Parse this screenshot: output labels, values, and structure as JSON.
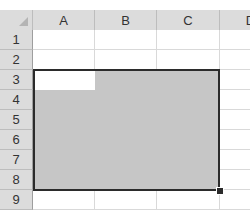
{
  "spreadsheet": {
    "columns": [
      {
        "label": "A",
        "left": 33,
        "width": 62
      },
      {
        "label": "B",
        "left": 95,
        "width": 62
      },
      {
        "label": "C",
        "left": 157,
        "width": 63
      },
      {
        "label": "D",
        "left": 220,
        "width": 62
      }
    ],
    "rows": [
      "1",
      "2",
      "3",
      "4",
      "5",
      "6",
      "7",
      "8",
      "9"
    ],
    "selection": {
      "range": "A3:C8",
      "active_cell": "A3",
      "fill_color": "#c6c6c6",
      "border_color": "#2b2b2b"
    },
    "header_bg": "#dcdcdc"
  }
}
